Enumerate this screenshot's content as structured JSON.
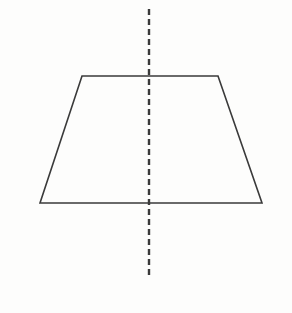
{
  "figure": {
    "background_color": "#fdfdfc",
    "stroke_color": "#3a3a3a",
    "stroke_width": 1.6,
    "canvas": {
      "width": 292,
      "height": 313
    },
    "shape": {
      "name": "trapezoid",
      "type": "isosceles-trapezoid",
      "fill": "none",
      "vertices": [
        {
          "label": "top-left",
          "x": 82,
          "y": 76
        },
        {
          "label": "top-right",
          "x": 218,
          "y": 76
        },
        {
          "label": "bottom-right",
          "x": 262,
          "y": 203
        },
        {
          "label": "bottom-left",
          "x": 40,
          "y": 203
        }
      ],
      "points_attr": "82,76 218,76 262,203 40,203",
      "edges": [
        {
          "name": "top-edge",
          "from": "top-left",
          "to": "top-right",
          "length_px": 136
        },
        {
          "name": "right-leg",
          "from": "top-right",
          "to": "bottom-right",
          "length_px": 134
        },
        {
          "name": "bottom-edge",
          "from": "bottom-right",
          "to": "bottom-left",
          "length_px": 222
        },
        {
          "name": "left-leg",
          "from": "bottom-left",
          "to": "top-left",
          "length_px": 134
        }
      ]
    },
    "symmetry_line": {
      "name": "line-of-symmetry",
      "orientation": "vertical",
      "style": "dashed",
      "x": 149,
      "y_start": 9,
      "y_end": 275,
      "dash_length": 6,
      "gap_length": 4,
      "stroke_width": 2.4,
      "stroke_color": "#3a3a3a"
    },
    "watermark": {
      "text": "",
      "color": "#f6f6f4"
    }
  }
}
